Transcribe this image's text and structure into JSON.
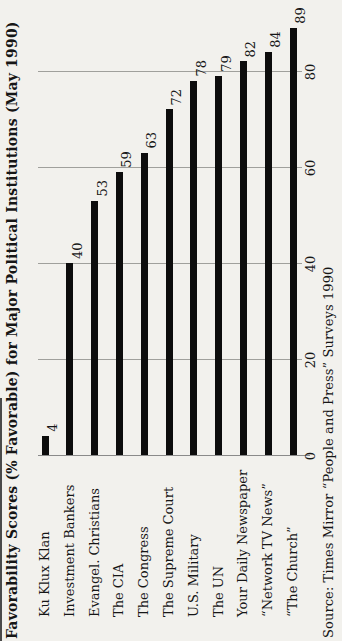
{
  "page": {
    "background": "#f2f1ed",
    "orientation_note": "landscape chart printed rotated 90 degrees CCW on a portrait page"
  },
  "chart_data": {
    "type": "bar",
    "orientation": "horizontal",
    "title": "Favorability Scores (% Favorable) for Major Political Institutions (May 1990)",
    "categories": [
      "Ku Klux Klan",
      "Investment Bankers",
      "Evangel. Christians",
      "The CIA",
      "The Congress",
      "The Supreme Court",
      "U.S. Military",
      "The UN",
      "Your Daily Newspaper",
      "“Network TV News”",
      "“The Church”"
    ],
    "values": [
      4,
      40,
      53,
      59,
      63,
      72,
      78,
      79,
      82,
      84,
      89
    ],
    "data_labels": [
      "4",
      "40",
      "53",
      "59",
      "63",
      "72",
      "78",
      "79",
      "82",
      "84",
      "89"
    ],
    "value_axis": {
      "ticks": [
        0,
        20,
        40,
        60,
        80
      ],
      "min": 0,
      "max": 92,
      "grid": true
    },
    "source": "Source: Times Mirror “People and Press” Surveys 1990",
    "bar_color": "#0d0d0d",
    "grid_color": "#a0a09c",
    "legend": "none"
  }
}
